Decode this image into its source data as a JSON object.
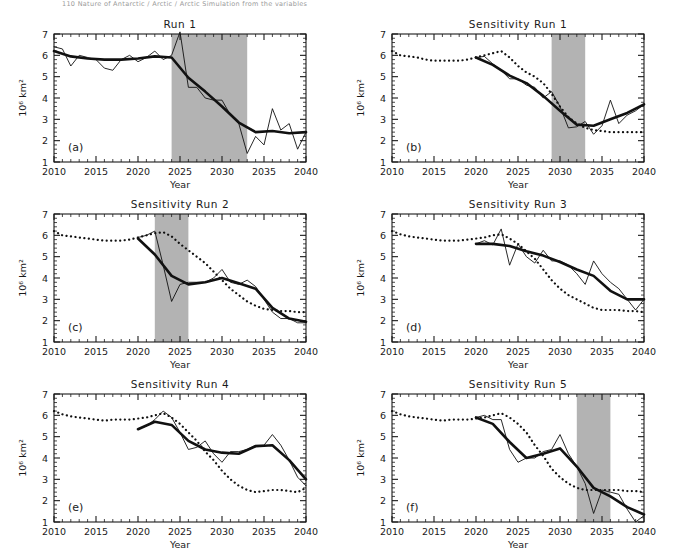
{
  "page_header": "110    Nature of Antarctic / Arctic / Arctic Simulation from the variables",
  "figure": {
    "axis": {
      "xlabel": "Year",
      "ylabel": "10⁶ km²",
      "xticks": [
        2010,
        2015,
        2020,
        2025,
        2030,
        2035,
        2040
      ],
      "yticks": [
        1,
        2,
        3,
        4,
        5,
        6,
        7
      ],
      "xlim": [
        2010,
        2040
      ],
      "ylim": [
        1,
        7
      ]
    },
    "colors": {
      "shade": "#b3b3b3",
      "line": "#111111",
      "axis": "#1a1a1a",
      "background": "#ffffff"
    },
    "panels": [
      {
        "id": "a",
        "label": "(a)",
        "title": "Run 1",
        "shade": [
          2024,
          2033
        ],
        "has_shade": true
      },
      {
        "id": "b",
        "label": "(b)",
        "title": "Sensitivity Run 1",
        "shade": [
          2029,
          2033
        ],
        "has_shade": true
      },
      {
        "id": "c",
        "label": "(c)",
        "title": "Sensitivity Run 2",
        "shade": [
          2022,
          2026
        ],
        "has_shade": true
      },
      {
        "id": "d",
        "label": "(d)",
        "title": "Sensitivity Run 3",
        "shade": null,
        "has_shade": false
      },
      {
        "id": "e",
        "label": "(e)",
        "title": "Sensitivity Run 4",
        "shade": null,
        "has_shade": false
      },
      {
        "id": "f",
        "label": "(f)",
        "title": "Sensitivity Run 5",
        "shade": [
          2032,
          2036
        ],
        "has_shade": true
      }
    ]
  },
  "chart_data": [
    {
      "type": "line",
      "panel": "a",
      "title": "Run 1",
      "xlabel": "Year",
      "ylabel": "10⁶ km²",
      "xlim": [
        2010,
        2040
      ],
      "ylim": [
        1,
        7
      ],
      "grid": false,
      "legend": "none",
      "shaded_span": [
        2024,
        2033
      ],
      "series": [
        {
          "name": "annual",
          "style": "thin-solid",
          "x": [
            2010,
            2011,
            2012,
            2013,
            2014,
            2015,
            2016,
            2017,
            2018,
            2019,
            2020,
            2021,
            2022,
            2023,
            2024,
            2025,
            2026,
            2027,
            2028,
            2029,
            2030,
            2031,
            2032,
            2033,
            2034,
            2035,
            2036,
            2037,
            2038,
            2039,
            2040
          ],
          "y": [
            6.4,
            6.3,
            5.5,
            6.0,
            5.9,
            5.8,
            5.4,
            5.3,
            5.8,
            6.0,
            5.7,
            5.9,
            6.2,
            5.8,
            6.0,
            7.1,
            4.5,
            4.5,
            4.0,
            3.9,
            3.9,
            3.2,
            2.8,
            1.4,
            2.2,
            1.8,
            3.5,
            2.5,
            2.8,
            1.6,
            2.4
          ]
        },
        {
          "name": "smoothed",
          "style": "thick-solid",
          "x": [
            2010,
            2012,
            2014,
            2016,
            2018,
            2020,
            2022,
            2024,
            2026,
            2028,
            2030,
            2032,
            2034,
            2036,
            2038,
            2040
          ],
          "y": [
            6.2,
            5.95,
            5.85,
            5.8,
            5.8,
            5.85,
            5.95,
            5.9,
            4.95,
            4.3,
            3.6,
            2.85,
            2.4,
            2.45,
            2.35,
            2.4
          ]
        }
      ]
    },
    {
      "type": "line",
      "panel": "b",
      "title": "Sensitivity Run 1",
      "xlabel": "Year",
      "ylabel": "10⁶ km²",
      "xlim": [
        2010,
        2040
      ],
      "ylim": [
        1,
        7
      ],
      "grid": false,
      "legend": "none",
      "shaded_span": [
        2029,
        2033
      ],
      "series": [
        {
          "name": "reference-dotted",
          "style": "dotted",
          "x": [
            2010,
            2011,
            2012,
            2013,
            2014,
            2015,
            2016,
            2017,
            2018,
            2019,
            2020,
            2021,
            2022,
            2023,
            2024,
            2025,
            2026,
            2027,
            2028,
            2029,
            2030,
            2031,
            2032,
            2033,
            2034,
            2035,
            2036,
            2037,
            2038,
            2039,
            2040
          ],
          "y": [
            6.2,
            6.0,
            5.95,
            5.9,
            5.8,
            5.75,
            5.75,
            5.75,
            5.75,
            5.8,
            5.9,
            6.0,
            6.1,
            6.2,
            5.9,
            5.5,
            5.2,
            5.0,
            4.7,
            4.2,
            3.6,
            3.1,
            2.8,
            2.6,
            2.5,
            2.45,
            2.4,
            2.4,
            2.4,
            2.4,
            2.4
          ]
        },
        {
          "name": "annual",
          "style": "thin-solid",
          "x": [
            2020,
            2021,
            2022,
            2023,
            2024,
            2025,
            2026,
            2027,
            2028,
            2029,
            2030,
            2031,
            2032,
            2033,
            2034,
            2035,
            2036,
            2037,
            2038,
            2039,
            2040
          ],
          "y": [
            5.9,
            5.95,
            5.6,
            5.3,
            4.9,
            4.9,
            4.6,
            4.5,
            4.0,
            4.3,
            3.6,
            2.6,
            2.65,
            2.9,
            2.3,
            2.7,
            3.9,
            2.8,
            3.2,
            3.4,
            3.7
          ]
        },
        {
          "name": "smoothed",
          "style": "thick-solid",
          "x": [
            2020,
            2022,
            2024,
            2026,
            2028,
            2030,
            2032,
            2034,
            2036,
            2038,
            2040
          ],
          "y": [
            5.9,
            5.55,
            5.05,
            4.7,
            4.1,
            3.4,
            2.75,
            2.7,
            3.0,
            3.3,
            3.7
          ]
        }
      ]
    },
    {
      "type": "line",
      "panel": "c",
      "title": "Sensitivity Run 2",
      "xlabel": "Year",
      "ylabel": "10⁶ km²",
      "xlim": [
        2010,
        2040
      ],
      "ylim": [
        1,
        7
      ],
      "grid": false,
      "legend": "none",
      "shaded_span": [
        2022,
        2026
      ],
      "series": [
        {
          "name": "reference-dotted",
          "style": "dotted",
          "x": [
            2010,
            2011,
            2012,
            2013,
            2014,
            2015,
            2016,
            2017,
            2018,
            2019,
            2020,
            2021,
            2022,
            2023,
            2024,
            2025,
            2026,
            2027,
            2028,
            2029,
            2030,
            2031,
            2032,
            2033,
            2034,
            2035,
            2036,
            2037,
            2038,
            2039,
            2040
          ],
          "y": [
            6.2,
            6.0,
            5.95,
            5.9,
            5.85,
            5.8,
            5.75,
            5.75,
            5.75,
            5.8,
            5.9,
            6.0,
            6.1,
            6.15,
            5.95,
            5.6,
            5.3,
            5.0,
            4.7,
            4.3,
            3.9,
            3.5,
            3.2,
            2.9,
            2.7,
            2.55,
            2.5,
            2.45,
            2.45,
            2.4,
            2.4
          ]
        },
        {
          "name": "annual",
          "style": "thin-solid",
          "x": [
            2020,
            2021,
            2022,
            2023,
            2024,
            2025,
            2026,
            2027,
            2028,
            2029,
            2030,
            2031,
            2032,
            2033,
            2034,
            2035,
            2036,
            2037,
            2038,
            2039,
            2040
          ],
          "y": [
            5.9,
            6.0,
            6.2,
            4.6,
            2.9,
            3.7,
            3.8,
            3.8,
            3.8,
            4.0,
            4.4,
            3.8,
            3.7,
            3.9,
            3.6,
            3.0,
            2.4,
            2.1,
            2.1,
            1.9,
            1.9
          ]
        },
        {
          "name": "smoothed",
          "style": "thick-solid",
          "x": [
            2020,
            2022,
            2024,
            2026,
            2028,
            2030,
            2032,
            2034,
            2036,
            2038,
            2040
          ],
          "y": [
            5.85,
            5.1,
            4.1,
            3.7,
            3.8,
            4.0,
            3.75,
            3.5,
            2.6,
            2.1,
            1.95
          ]
        }
      ]
    },
    {
      "type": "line",
      "panel": "d",
      "title": "Sensitivity Run 3",
      "xlabel": "Year",
      "ylabel": "10⁶ km²",
      "xlim": [
        2010,
        2040
      ],
      "ylim": [
        1,
        7
      ],
      "grid": false,
      "legend": "none",
      "shaded_span": null,
      "series": [
        {
          "name": "reference-dotted",
          "style": "dotted",
          "x": [
            2010,
            2011,
            2012,
            2013,
            2014,
            2015,
            2016,
            2017,
            2018,
            2019,
            2020,
            2021,
            2022,
            2023,
            2024,
            2025,
            2026,
            2027,
            2028,
            2029,
            2030,
            2031,
            2032,
            2033,
            2034,
            2035,
            2036,
            2037,
            2038,
            2039,
            2040
          ],
          "y": [
            6.2,
            6.05,
            5.95,
            5.9,
            5.85,
            5.8,
            5.75,
            5.75,
            5.75,
            5.8,
            5.85,
            5.9,
            6.0,
            6.05,
            5.85,
            5.6,
            5.25,
            4.9,
            4.4,
            3.9,
            3.5,
            3.2,
            3.0,
            2.8,
            2.6,
            2.5,
            2.5,
            2.5,
            2.45,
            2.45,
            2.4
          ]
        },
        {
          "name": "annual",
          "style": "thin-solid",
          "x": [
            2020,
            2021,
            2022,
            2023,
            2024,
            2025,
            2026,
            2027,
            2028,
            2029,
            2030,
            2031,
            2032,
            2033,
            2034,
            2035,
            2036,
            2037,
            2038,
            2039,
            2040
          ],
          "y": [
            5.6,
            5.75,
            5.55,
            6.3,
            4.6,
            5.6,
            5.0,
            4.7,
            5.3,
            4.8,
            4.8,
            4.6,
            4.2,
            3.7,
            4.8,
            4.2,
            3.8,
            3.5,
            3.0,
            2.5,
            3.0
          ]
        },
        {
          "name": "smoothed",
          "style": "thick-solid",
          "x": [
            2020,
            2022,
            2024,
            2026,
            2028,
            2030,
            2032,
            2034,
            2036,
            2038,
            2040
          ],
          "y": [
            5.6,
            5.6,
            5.5,
            5.25,
            5.05,
            4.75,
            4.4,
            4.1,
            3.4,
            3.0,
            3.0
          ]
        }
      ]
    },
    {
      "type": "line",
      "panel": "e",
      "title": "Sensitivity Run 4",
      "xlabel": "Year",
      "ylabel": "10⁶ km²",
      "xlim": [
        2010,
        2040
      ],
      "ylim": [
        1,
        7
      ],
      "grid": false,
      "legend": "none",
      "shaded_span": null,
      "series": [
        {
          "name": "reference-dotted",
          "style": "dotted",
          "x": [
            2010,
            2011,
            2012,
            2013,
            2014,
            2015,
            2016,
            2017,
            2018,
            2019,
            2020,
            2021,
            2022,
            2023,
            2024,
            2025,
            2026,
            2027,
            2028,
            2029,
            2030,
            2031,
            2032,
            2033,
            2034,
            2035,
            2036,
            2037,
            2038,
            2039,
            2040
          ],
          "y": [
            6.2,
            6.05,
            5.95,
            5.9,
            5.85,
            5.8,
            5.75,
            5.8,
            5.8,
            5.8,
            5.85,
            5.9,
            6.0,
            6.1,
            5.9,
            5.6,
            5.2,
            4.8,
            4.3,
            3.9,
            3.4,
            3.0,
            2.7,
            2.5,
            2.4,
            2.45,
            2.5,
            2.5,
            2.45,
            2.4,
            2.6
          ]
        },
        {
          "name": "annual",
          "style": "thin-solid",
          "x": [
            2020,
            2021,
            2022,
            2023,
            2024,
            2025,
            2026,
            2027,
            2028,
            2029,
            2030,
            2031,
            2032,
            2033,
            2034,
            2035,
            2036,
            2037,
            2038,
            2039,
            2040
          ],
          "y": [
            5.35,
            5.5,
            5.8,
            6.2,
            5.9,
            5.2,
            4.4,
            4.5,
            4.8,
            4.2,
            3.8,
            4.3,
            4.3,
            4.4,
            4.6,
            4.6,
            5.1,
            4.6,
            3.9,
            3.1,
            2.7
          ]
        },
        {
          "name": "smoothed",
          "style": "thick-solid",
          "x": [
            2020,
            2022,
            2024,
            2026,
            2028,
            2030,
            2032,
            2034,
            2036,
            2038,
            2040
          ],
          "y": [
            5.35,
            5.7,
            5.55,
            4.8,
            4.4,
            4.25,
            4.2,
            4.55,
            4.6,
            3.9,
            3.0
          ]
        }
      ]
    },
    {
      "type": "line",
      "panel": "f",
      "title": "Sensitivity Run 5",
      "xlabel": "Year",
      "ylabel": "10⁶ km²",
      "xlim": [
        2010,
        2040
      ],
      "ylim": [
        1,
        7
      ],
      "grid": false,
      "legend": "none",
      "shaded_span": [
        2032,
        2036
      ],
      "series": [
        {
          "name": "reference-dotted",
          "style": "dotted",
          "x": [
            2010,
            2011,
            2012,
            2013,
            2014,
            2015,
            2016,
            2017,
            2018,
            2019,
            2020,
            2021,
            2022,
            2023,
            2024,
            2025,
            2026,
            2027,
            2028,
            2029,
            2030,
            2031,
            2032,
            2033,
            2034,
            2035,
            2036,
            2037,
            2038,
            2039,
            2040
          ],
          "y": [
            6.2,
            6.05,
            5.95,
            5.9,
            5.85,
            5.8,
            5.75,
            5.8,
            5.8,
            5.8,
            5.85,
            5.9,
            6.0,
            6.1,
            5.9,
            5.6,
            5.2,
            4.6,
            4.1,
            3.5,
            3.1,
            2.8,
            2.6,
            2.5,
            2.5,
            2.5,
            2.5,
            2.5,
            2.45,
            2.45,
            2.4
          ]
        },
        {
          "name": "annual",
          "style": "thin-solid",
          "x": [
            2020,
            2021,
            2022,
            2023,
            2024,
            2025,
            2026,
            2027,
            2028,
            2029,
            2030,
            2031,
            2032,
            2033,
            2034,
            2035,
            2036,
            2037,
            2038,
            2039,
            2040
          ],
          "y": [
            5.9,
            6.0,
            5.8,
            5.8,
            4.4,
            3.8,
            4.0,
            4.0,
            4.3,
            4.4,
            5.1,
            4.2,
            3.6,
            2.8,
            1.4,
            2.5,
            2.4,
            2.3,
            1.6,
            1.0,
            1.3
          ]
        },
        {
          "name": "smoothed",
          "style": "thick-solid",
          "x": [
            2020,
            2022,
            2024,
            2026,
            2028,
            2030,
            2032,
            2034,
            2036,
            2038,
            2040
          ],
          "y": [
            5.9,
            5.6,
            4.75,
            4.0,
            4.2,
            4.45,
            3.6,
            2.6,
            2.2,
            1.7,
            1.35
          ]
        }
      ]
    }
  ]
}
